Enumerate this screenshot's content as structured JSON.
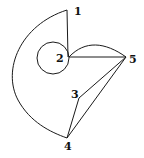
{
  "diagram": {
    "type": "multigraph",
    "colors": {
      "stroke": "#1a1a1a",
      "label": "#111111",
      "background": "#ffffff"
    },
    "nodes": [
      {
        "id": "1",
        "label": "1",
        "x": 67,
        "y": 10,
        "label_x": 74,
        "label_y": 15
      },
      {
        "id": "2",
        "label": "2",
        "x": 69,
        "y": 57,
        "label_x": 56,
        "label_y": 62
      },
      {
        "id": "3",
        "label": "3",
        "x": 79,
        "y": 98,
        "label_x": 71,
        "label_y": 98
      },
      {
        "id": "4",
        "label": "4",
        "x": 67,
        "y": 138,
        "label_x": 64,
        "label_y": 150
      },
      {
        "id": "5",
        "label": "5",
        "x": 126,
        "y": 57,
        "label_x": 129,
        "label_y": 63
      }
    ],
    "edges": [
      {
        "from": "1",
        "to": "2",
        "shape": "straight"
      },
      {
        "from": "1",
        "to": "4",
        "shape": "curve-left"
      },
      {
        "from": "2",
        "to": "2",
        "shape": "loop"
      },
      {
        "from": "2",
        "to": "5",
        "shape": "straight"
      },
      {
        "from": "2",
        "to": "5",
        "shape": "arc-above"
      },
      {
        "from": "5",
        "to": "3",
        "shape": "straight"
      },
      {
        "from": "5",
        "to": "4",
        "shape": "straight"
      },
      {
        "from": "3",
        "to": "4",
        "shape": "straight"
      }
    ]
  }
}
